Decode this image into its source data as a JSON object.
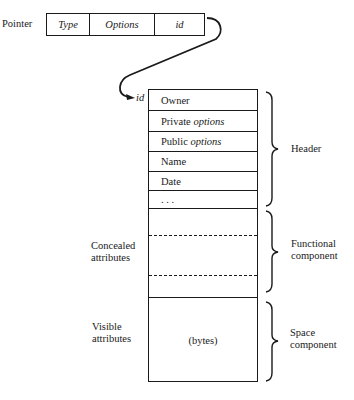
{
  "pointer": {
    "label": "Pointer",
    "fields": [
      {
        "label": "Type",
        "italic": true
      },
      {
        "label": "Options",
        "italic": true
      },
      {
        "label": "id",
        "italic": true
      }
    ]
  },
  "record": {
    "entry_label": "id",
    "header_rows": [
      {
        "prefix": "Owner",
        "italic_part": ""
      },
      {
        "prefix": "Private ",
        "italic_part": "options"
      },
      {
        "prefix": "Public ",
        "italic_part": "options"
      },
      {
        "prefix": "Name",
        "italic_part": ""
      },
      {
        "prefix": "Date",
        "italic_part": ""
      },
      {
        "prefix": ". . .",
        "italic_part": ""
      }
    ],
    "space_content": "(bytes)"
  },
  "left_labels": {
    "concealed": [
      "Concealed",
      "attributes"
    ],
    "visible": [
      "Visible",
      "attributes"
    ]
  },
  "right_labels": {
    "header": [
      "Header"
    ],
    "functional": [
      "Functional",
      "component"
    ],
    "space": [
      "Space",
      "component"
    ]
  }
}
